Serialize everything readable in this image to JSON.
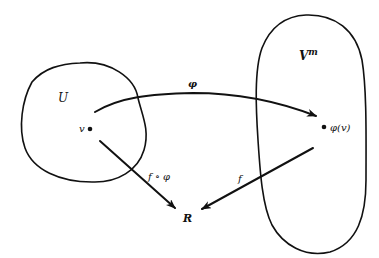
{
  "diagram": {
    "sets": {
      "domain": {
        "label": "U"
      },
      "codomain": {
        "label": "V",
        "superscript": "m"
      }
    },
    "points": {
      "source": {
        "label": "v"
      },
      "image": {
        "label": "φ(v)"
      }
    },
    "target": {
      "label": "R"
    },
    "arrows": {
      "phi": {
        "label": "φ",
        "from": "v",
        "to": "φ(v)"
      },
      "composite": {
        "label": "f ∘ φ",
        "from": "v",
        "to": "R"
      },
      "f": {
        "label": "f",
        "from": "φ(v)",
        "to": "R"
      }
    },
    "colors": {
      "ink": "#111111",
      "background": "#ffffff"
    }
  }
}
